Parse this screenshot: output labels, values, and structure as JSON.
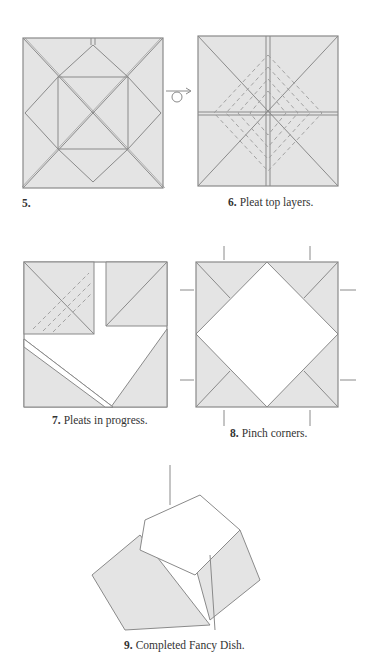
{
  "colors": {
    "paper_fill": "#e4e4e4",
    "line": "#8a8a8a",
    "background": "#ffffff"
  },
  "steps": [
    {
      "number": "5.",
      "caption": ""
    },
    {
      "number": "6.",
      "caption": "Pleat top layers."
    },
    {
      "number": "7.",
      "caption": "Pleats in progress."
    },
    {
      "number": "8.",
      "caption": "Pinch corners."
    },
    {
      "number": "9.",
      "caption": "Completed Fancy Dish."
    }
  ],
  "symbols": {
    "turn_over": "turn-over-icon"
  }
}
